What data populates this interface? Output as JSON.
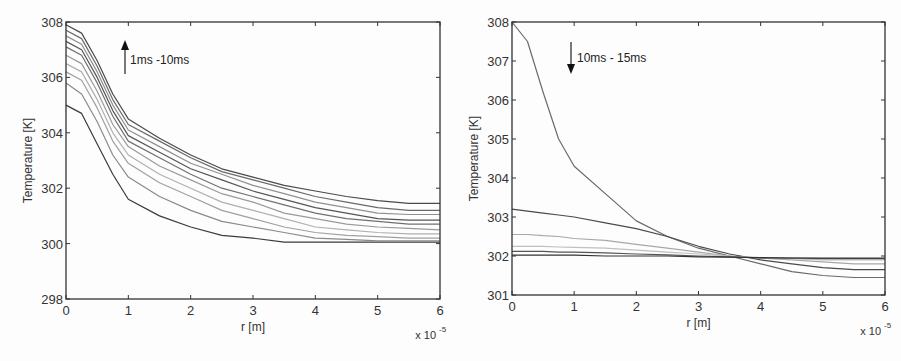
{
  "chart_data": [
    {
      "type": "line",
      "title": "",
      "xlabel": "r [m]",
      "ylabel": "Temperature [K]",
      "x_multiplier": "x 10^-5",
      "x_multiplier_base": "x 10",
      "x_multiplier_exp": "-5",
      "xlim": [
        0,
        6
      ],
      "ylim": [
        298,
        308
      ],
      "xticks": [
        "0",
        "1",
        "2",
        "3",
        "4",
        "5",
        "6"
      ],
      "yticks": [
        "298",
        "300",
        "302",
        "304",
        "306",
        "308"
      ],
      "grid": false,
      "annotation": {
        "text": "1ms -10ms",
        "arrow": "up"
      },
      "x": [
        0,
        0.25,
        0.5,
        0.75,
        1.0,
        1.5,
        2.0,
        2.5,
        3.0,
        3.5,
        4.0,
        4.5,
        5.0,
        5.5,
        6.0
      ],
      "series": [
        {
          "name": "1ms",
          "color": "#3a3a3a",
          "values": [
            305.0,
            304.7,
            303.6,
            302.5,
            301.6,
            301.0,
            300.6,
            300.3,
            300.2,
            300.05,
            300.05,
            300.05,
            300.05,
            300.05,
            300.05
          ]
        },
        {
          "name": "2ms",
          "color": "#8a8a8a",
          "values": [
            305.8,
            305.4,
            304.4,
            303.2,
            302.4,
            301.7,
            301.2,
            300.8,
            300.6,
            300.4,
            300.2,
            300.15,
            300.1,
            300.1,
            300.1
          ]
        },
        {
          "name": "3ms",
          "color": "#a0a0a0",
          "values": [
            306.2,
            305.9,
            304.9,
            303.7,
            302.9,
            302.2,
            301.7,
            301.2,
            300.9,
            300.6,
            300.4,
            300.3,
            300.25,
            300.2,
            300.2
          ]
        },
        {
          "name": "4ms",
          "color": "#b0b0b0",
          "values": [
            306.5,
            306.2,
            305.2,
            304.0,
            303.2,
            302.5,
            302.0,
            301.5,
            301.2,
            300.9,
            300.6,
            300.5,
            300.4,
            300.35,
            300.35
          ]
        },
        {
          "name": "5ms",
          "color": "#9a9a9a",
          "values": [
            306.8,
            306.5,
            305.5,
            304.3,
            303.5,
            302.8,
            302.3,
            301.8,
            301.5,
            301.1,
            300.9,
            300.7,
            300.6,
            300.55,
            300.5
          ]
        },
        {
          "name": "6ms",
          "color": "#707070",
          "values": [
            307.1,
            306.8,
            305.8,
            304.6,
            303.7,
            303.1,
            302.5,
            302.0,
            301.7,
            301.4,
            301.1,
            300.9,
            300.8,
            300.7,
            300.7
          ]
        },
        {
          "name": "7ms",
          "color": "#555555",
          "values": [
            307.3,
            307.0,
            306.0,
            304.8,
            303.9,
            303.3,
            302.7,
            302.3,
            301.9,
            301.6,
            301.3,
            301.1,
            300.9,
            300.85,
            300.85
          ]
        },
        {
          "name": "8ms",
          "color": "#909090",
          "values": [
            307.5,
            307.2,
            306.2,
            305.0,
            304.1,
            303.5,
            302.9,
            302.5,
            302.1,
            301.8,
            301.5,
            301.3,
            301.1,
            301.05,
            301.05
          ]
        },
        {
          "name": "9ms",
          "color": "#6a6a6a",
          "values": [
            307.7,
            307.4,
            306.4,
            305.2,
            304.3,
            303.7,
            303.1,
            302.6,
            302.3,
            302.0,
            301.7,
            301.5,
            301.3,
            301.2,
            301.2
          ]
        },
        {
          "name": "10ms",
          "color": "#4a4a4a",
          "values": [
            307.9,
            307.6,
            306.6,
            305.4,
            304.5,
            303.8,
            303.2,
            302.7,
            302.4,
            302.1,
            301.9,
            301.7,
            301.55,
            301.45,
            301.45
          ]
        }
      ]
    },
    {
      "type": "line",
      "title": "",
      "xlabel": "r [m]",
      "ylabel": "Temperature [K]",
      "x_multiplier": "x 10^-5",
      "x_multiplier_base": "x 10",
      "x_multiplier_exp": "-5",
      "xlim": [
        0,
        6
      ],
      "ylim": [
        301,
        308
      ],
      "xticks": [
        "0",
        "1",
        "2",
        "3",
        "4",
        "5",
        "6"
      ],
      "yticks": [
        "301",
        "302",
        "303",
        "304",
        "305",
        "306",
        "307",
        "308"
      ],
      "grid": false,
      "annotation": {
        "text": "10ms - 15ms",
        "arrow": "down"
      },
      "x": [
        0,
        0.25,
        0.5,
        0.75,
        1.0,
        1.5,
        2.0,
        2.5,
        3.0,
        3.5,
        4.0,
        4.5,
        5.0,
        5.5,
        6.0
      ],
      "series": [
        {
          "name": "10ms",
          "color": "#6a6a6a",
          "values": [
            308.0,
            307.5,
            306.2,
            305.0,
            304.3,
            303.6,
            302.9,
            302.5,
            302.2,
            302.0,
            301.8,
            301.6,
            301.5,
            301.45,
            301.45
          ]
        },
        {
          "name": "11ms",
          "color": "#4a4a4a",
          "values": [
            303.2,
            303.15,
            303.1,
            303.05,
            303.0,
            302.85,
            302.7,
            302.5,
            302.25,
            302.05,
            301.9,
            301.8,
            301.7,
            301.65,
            301.65
          ]
        },
        {
          "name": "12ms",
          "color": "#a8a8a8",
          "values": [
            302.55,
            302.55,
            302.52,
            302.5,
            302.45,
            302.4,
            302.3,
            302.2,
            302.1,
            302.0,
            301.95,
            301.9,
            301.85,
            301.8,
            301.8
          ]
        },
        {
          "name": "13ms",
          "color": "#c0c0c0",
          "values": [
            302.25,
            302.25,
            302.25,
            302.23,
            302.22,
            302.2,
            302.15,
            302.1,
            302.05,
            302.0,
            301.95,
            301.93,
            301.9,
            301.9,
            301.9
          ]
        },
        {
          "name": "14ms",
          "color": "#555555",
          "values": [
            302.12,
            302.12,
            302.12,
            302.1,
            302.1,
            302.08,
            302.05,
            302.03,
            302.0,
            301.98,
            301.95,
            301.95,
            301.93,
            301.93,
            301.93
          ]
        },
        {
          "name": "15ms",
          "color": "#333333",
          "values": [
            302.02,
            302.02,
            302.02,
            302.02,
            302.02,
            302.0,
            302.0,
            302.0,
            301.98,
            301.97,
            301.96,
            301.95,
            301.95,
            301.95,
            301.95
          ]
        }
      ]
    }
  ],
  "panels": [
    {
      "id": "left",
      "box": {
        "x0": 66,
        "x1": 440,
        "y_top": 22,
        "y_bottom": 299
      }
    },
    {
      "id": "right",
      "box": {
        "x0": 512,
        "x1": 885,
        "y_top": 22,
        "y_bottom": 295
      }
    }
  ]
}
